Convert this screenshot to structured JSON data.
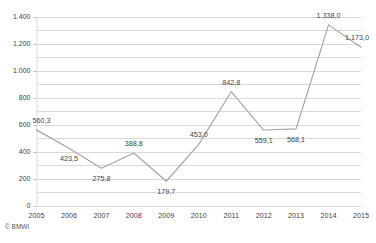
{
  "credit": "© BMWi",
  "title_clip": "",
  "chart_data": {
    "type": "line",
    "title": "",
    "subtitle": "",
    "xlabel": "",
    "ylabel": "",
    "categories": [
      "2005",
      "2006",
      "2007",
      "2008",
      "2009",
      "2010",
      "2011",
      "2012",
      "2013",
      "2014",
      "2015"
    ],
    "values": [
      560.3,
      423.5,
      275.8,
      388.8,
      179.7,
      453.0,
      842.8,
      559.1,
      568.1,
      1338.0,
      1173.0
    ],
    "point_labels": [
      "560,3",
      "423,5",
      "275,8",
      "388,8",
      "179,7",
      "453,0",
      "842,8",
      "559,1",
      "568,1",
      "1.338,0",
      "1.173,0"
    ],
    "label_positions": [
      "above",
      "below",
      "below",
      "above",
      "below",
      "above",
      "above",
      "below",
      "below",
      "above",
      "above"
    ],
    "ylim": [
      0,
      1400
    ],
    "ytick_values": [
      0,
      200,
      400,
      600,
      800,
      1000,
      1200,
      1400
    ],
    "ytick_labels": [
      "0",
      "200",
      "400",
      "600",
      "800",
      "1.000",
      "1.200",
      "1.400"
    ],
    "gridline_step": 100,
    "grid": true,
    "legend": "none",
    "series_name": "",
    "series_color": "#a6a6a6",
    "grid_color": "#d9d9d9",
    "number_format": "de-DE"
  }
}
